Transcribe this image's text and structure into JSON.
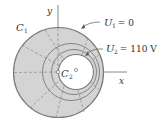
{
  "diagram": {
    "labels": {
      "y_axis": "y",
      "x_axis": "x",
      "c1": "C",
      "c1_sub": "1",
      "c2": "C",
      "c2_sub": "2",
      "u1": "U",
      "u1_sub": "1",
      "u1_value": " = 0",
      "u2": "U",
      "u2_sub": "2",
      "u2_value": " = 110 V"
    },
    "colors": {
      "fill": "#d4d4d4",
      "stroke": "#7a7a7a",
      "text": "#333333"
    }
  }
}
